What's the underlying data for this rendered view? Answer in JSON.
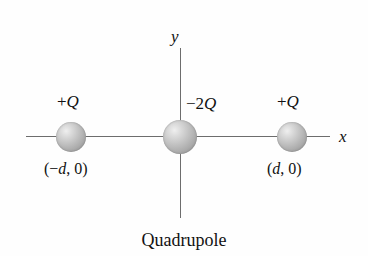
{
  "figure": {
    "caption": "Quadrupole",
    "axes": {
      "x_label": "x",
      "y_label": "y"
    },
    "charges": [
      {
        "name": "left-positive-charge",
        "charge_label_sign": "+",
        "charge_label_symbol": "Q",
        "coordinate_label": "(−d, 0)",
        "coord_open": "(−",
        "coord_symbol": "d",
        "coord_close": ", 0)"
      },
      {
        "name": "center-negative-charge",
        "charge_label_sign": "−2",
        "charge_label_symbol": "Q",
        "coordinate_label": "",
        "coord_open": "",
        "coord_symbol": "",
        "coord_close": ""
      },
      {
        "name": "right-positive-charge",
        "charge_label_sign": "+",
        "charge_label_symbol": "Q",
        "coordinate_label": "(d, 0)",
        "coord_open": "(",
        "coord_symbol": "d",
        "coord_close": ", 0)"
      }
    ],
    "colors": {
      "background": "#fefefe",
      "axis_line": "#6d6d6d",
      "text": "#111111",
      "sphere_highlight": "#efefef",
      "sphere_edge": "#8a8a8a"
    }
  }
}
